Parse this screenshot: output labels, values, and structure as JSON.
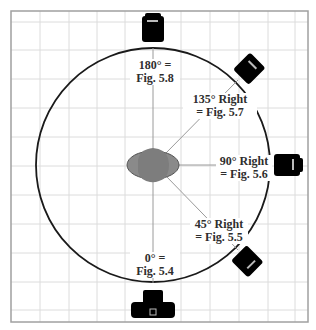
{
  "diagram": {
    "type": "camera-angle-diagram",
    "grid": {
      "color": "#dcdcdc",
      "frame_color": "#9a9a9a",
      "spacing_px": 29
    },
    "circle": {
      "stroke": "#1a1a1a"
    },
    "subject": {
      "fill": "#8a8a8a",
      "stroke": "#555555"
    },
    "camera_color": "#000000",
    "positions": [
      {
        "id": "180",
        "line1": "180° =",
        "line2": "Fig. 5.8"
      },
      {
        "id": "135",
        "line1": "135° Right",
        "line2": "= Fig. 5.7"
      },
      {
        "id": "90",
        "line1": "90° Right",
        "line2": "= Fig. 5.6"
      },
      {
        "id": "45",
        "line1": "45° Right",
        "line2": "= Fig. 5.5"
      },
      {
        "id": "0",
        "line1": "0° =",
        "line2": "Fig. 5.4"
      }
    ]
  }
}
